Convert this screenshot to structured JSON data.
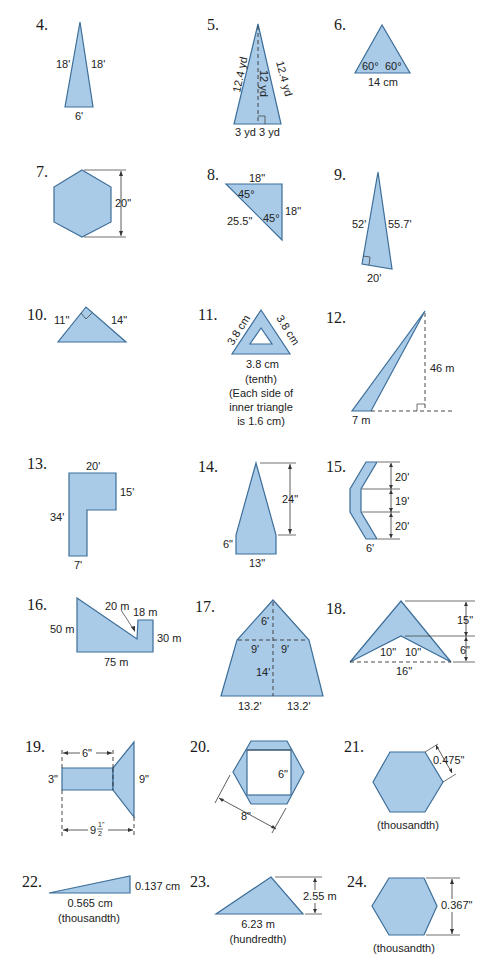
{
  "problems": [
    {
      "number": "4.",
      "shape": "isosceles triangle",
      "labels": {
        "left": "18'",
        "right": "18'",
        "base": "6'"
      }
    },
    {
      "number": "5.",
      "shape": "isosceles triangle with altitude",
      "labels": {
        "left": "12.4 yd",
        "right": "12.4 yd",
        "height": "12 yd",
        "base_left": "3 yd",
        "base_right": "3 yd"
      }
    },
    {
      "number": "6.",
      "shape": "equilateral triangle",
      "labels": {
        "angle_left": "60°",
        "angle_right": "60°",
        "base": "14 cm"
      }
    },
    {
      "number": "7.",
      "shape": "regular hexagon",
      "labels": {
        "height": "20\""
      }
    },
    {
      "number": "8.",
      "shape": "right triangle",
      "labels": {
        "top": "18\"",
        "angle_top": "45°",
        "angle_bottom": "45°",
        "right": "18\"",
        "hypotenuse": "25.5\""
      }
    },
    {
      "number": "9.",
      "shape": "right triangle",
      "labels": {
        "left": "52'",
        "right": "55.7'",
        "base": "20'"
      }
    },
    {
      "number": "10.",
      "shape": "right triangle",
      "labels": {
        "left": "11\"",
        "right": "14\""
      }
    },
    {
      "number": "11.",
      "shape": "triangle with triangular hole",
      "labels": {
        "left": "3.8 cm",
        "right": "3.8 cm",
        "base": "3.8 cm",
        "precision": "(tenth)",
        "note_1": "(Each side of",
        "note_2": "inner triangle",
        "note_3": "is 1.6 cm)"
      }
    },
    {
      "number": "12.",
      "shape": "obtuse triangle",
      "labels": {
        "height": "46 m",
        "base": "7 m"
      }
    },
    {
      "number": "13.",
      "shape": "L-shape",
      "labels": {
        "top": "20'",
        "right": "15'",
        "left": "34'",
        "bottom": "7'"
      }
    },
    {
      "number": "14.",
      "shape": "pentagon",
      "labels": {
        "height": "24\"",
        "side": "6\"",
        "base": "13\""
      }
    },
    {
      "number": "15.",
      "shape": "chevron band",
      "labels": {
        "top": "20'",
        "middle": "19'",
        "bottom_seg": "20'",
        "width": "6'"
      }
    },
    {
      "number": "16.",
      "shape": "composite polygon",
      "labels": {
        "left": "50 m",
        "slope": "20 m",
        "notch": "18 m",
        "right": "30 m",
        "bottom": "75 m"
      }
    },
    {
      "number": "17.",
      "shape": "triangle over trapezoid",
      "labels": {
        "tri_height": "6'",
        "half_left": "9'",
        "half_right": "9'",
        "trap_height": "14'",
        "base_left": "13.2'",
        "base_right": "13.2'"
      }
    },
    {
      "number": "18.",
      "shape": "arrowhead",
      "labels": {
        "top_height": "15\"",
        "inner_height": "6\"",
        "inner_left": "10\"",
        "inner_right": "10\"",
        "base": "16\""
      }
    },
    {
      "number": "19.",
      "shape": "rectangle plus trapezoid",
      "labels": {
        "rect_len": "6\"",
        "rect_h": "3\"",
        "trap_h": "9\"",
        "total_whole": "9",
        "total_num": "1",
        "total_den": "2",
        "total_unit": "\""
      }
    },
    {
      "number": "20.",
      "shape": "hexagon with square hole",
      "labels": {
        "square": "6\"",
        "hex": "8\""
      }
    },
    {
      "number": "21.",
      "shape": "regular hexagon",
      "labels": {
        "side": "0.475\"",
        "precision": "(thousandth)"
      }
    },
    {
      "number": "22.",
      "shape": "right triangle",
      "labels": {
        "right": "0.137 cm",
        "base": "0.565 cm",
        "precision": "(thousandth)"
      }
    },
    {
      "number": "23.",
      "shape": "triangle",
      "labels": {
        "height": "2.55 m",
        "base": "6.23 m",
        "precision": "(hundredth)"
      }
    },
    {
      "number": "24.",
      "shape": "regular hexagon",
      "labels": {
        "height": "0.367\"",
        "precision": "(thousandth)"
      }
    }
  ],
  "colors": {
    "fill": "#a9cbe8",
    "stroke": "#3d6e99",
    "text": "#222222"
  }
}
